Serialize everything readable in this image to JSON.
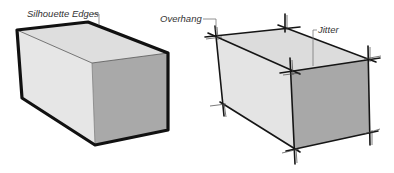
{
  "diagram": {
    "panels": [
      {
        "id": "left",
        "description": "Box rendered with thick silhouette edges",
        "labels": [
          {
            "text": "Silhouette Edges"
          }
        ]
      },
      {
        "id": "right",
        "description": "Box rendered with sketchy edge overhang and jitter",
        "labels": [
          {
            "text": "Overhang"
          },
          {
            "text": "Jitter"
          }
        ]
      }
    ],
    "colors": {
      "background": "#ffffff",
      "top_face": "#dedede",
      "left_face": "#e4e4e4",
      "front_face": "#a8a8a8",
      "edge": "#111111",
      "leader": "#777777"
    }
  }
}
